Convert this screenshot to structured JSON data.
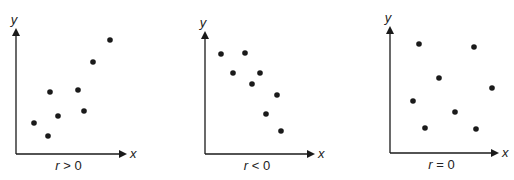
{
  "chart_data": [
    {
      "type": "scatter",
      "title": "r > 0",
      "xlabel": "x",
      "ylabel": "y",
      "caption": {
        "var": "r",
        "op": ">",
        "val": "0"
      },
      "grid": false,
      "origin": [
        16,
        154
      ],
      "ytop": 28,
      "xend": 127,
      "points_px": [
        [
          34,
          123
        ],
        [
          48,
          136
        ],
        [
          50,
          92
        ],
        [
          58,
          116
        ],
        [
          78,
          90
        ],
        [
          84,
          111
        ],
        [
          93,
          62
        ],
        [
          110,
          40
        ]
      ]
    },
    {
      "type": "scatter",
      "title": "r < 0",
      "xlabel": "x",
      "ylabel": "y",
      "caption": {
        "var": "r",
        "op": "<",
        "val": "0"
      },
      "grid": false,
      "origin": [
        205,
        154
      ],
      "ytop": 31,
      "xend": 315,
      "points_px": [
        [
          221,
          54
        ],
        [
          245,
          53
        ],
        [
          233,
          73
        ],
        [
          260,
          73
        ],
        [
          252,
          84
        ],
        [
          277,
          95
        ],
        [
          266,
          114
        ],
        [
          281,
          131
        ]
      ]
    },
    {
      "type": "scatter",
      "title": "r = 0",
      "xlabel": "x",
      "ylabel": "y",
      "caption": {
        "var": "r",
        "op": "=",
        "val": "0"
      },
      "grid": false,
      "origin": [
        390,
        153
      ],
      "ytop": 26,
      "xend": 499,
      "points_px": [
        [
          419,
          44
        ],
        [
          474,
          47
        ],
        [
          439,
          78
        ],
        [
          492,
          88
        ],
        [
          413,
          101
        ],
        [
          455,
          112
        ],
        [
          425,
          128
        ],
        [
          476,
          129
        ]
      ]
    }
  ],
  "colors": {
    "ink": "#1a1a1a"
  }
}
